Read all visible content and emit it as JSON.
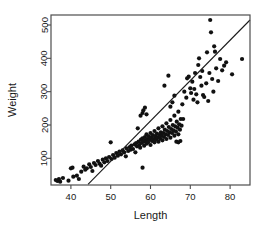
{
  "chart_data": {
    "type": "scatter",
    "title": "",
    "xlabel": "Length",
    "ylabel": "Weight",
    "xlim": [
      35,
      85
    ],
    "ylim": [
      20,
      530
    ],
    "xticks": [
      40,
      50,
      60,
      70,
      80
    ],
    "yticks": [
      100,
      200,
      300,
      400,
      500
    ],
    "xtick_labels": [
      "40",
      "50",
      "60",
      "70",
      "80"
    ],
    "ytick_labels": [
      "100",
      "200",
      "300",
      "400",
      "500"
    ],
    "grid": false,
    "legend": null,
    "point_color": "#111111",
    "line_color": "#1a1a1a",
    "frame_color": "#4d4d4d",
    "background": "#ffffff",
    "ytick_label_rotation": -90,
    "ylabel_rotation": -90,
    "fit_line": {
      "type": "linear-regression",
      "x_start": 44.3,
      "y_start": 22,
      "x_end": 85.0,
      "y_end": 515
    },
    "n_points": 162,
    "points": [
      [
        36.2,
        35
      ],
      [
        36.6,
        32
      ],
      [
        37.0,
        38
      ],
      [
        37.3,
        30
      ],
      [
        38.0,
        41
      ],
      [
        39.4,
        33
      ],
      [
        40.0,
        70
      ],
      [
        40.4,
        72
      ],
      [
        40.6,
        45
      ],
      [
        41.5,
        48
      ],
      [
        42.0,
        38
      ],
      [
        42.6,
        60
      ],
      [
        43.2,
        75
      ],
      [
        43.6,
        66
      ],
      [
        44.0,
        70
      ],
      [
        44.6,
        82
      ],
      [
        45.0,
        74
      ],
      [
        45.4,
        62
      ],
      [
        45.8,
        86
      ],
      [
        46.2,
        80
      ],
      [
        46.8,
        92
      ],
      [
        47.2,
        84
      ],
      [
        47.6,
        78
      ],
      [
        48.0,
        96
      ],
      [
        48.4,
        88
      ],
      [
        48.8,
        100
      ],
      [
        49.2,
        92
      ],
      [
        49.6,
        104
      ],
      [
        50.0,
        148
      ],
      [
        50.2,
        98
      ],
      [
        50.6,
        110
      ],
      [
        51.0,
        102
      ],
      [
        51.4,
        116
      ],
      [
        51.8,
        108
      ],
      [
        52.2,
        120
      ],
      [
        52.6,
        112
      ],
      [
        53.0,
        124
      ],
      [
        53.4,
        118
      ],
      [
        53.8,
        106
      ],
      [
        54.0,
        130
      ],
      [
        54.4,
        122
      ],
      [
        54.8,
        134
      ],
      [
        55.0,
        126
      ],
      [
        55.2,
        138
      ],
      [
        55.6,
        128
      ],
      [
        56.0,
        142
      ],
      [
        56.2,
        118
      ],
      [
        56.4,
        146
      ],
      [
        56.6,
        136
      ],
      [
        56.8,
        190
      ],
      [
        57.0,
        150
      ],
      [
        57.2,
        140
      ],
      [
        57.4,
        132
      ],
      [
        57.6,
        156
      ],
      [
        57.8,
        146
      ],
      [
        58.0,
        160
      ],
      [
        58.0,
        72
      ],
      [
        58.2,
        150
      ],
      [
        58.4,
        138
      ],
      [
        58.6,
        164
      ],
      [
        58.8,
        154
      ],
      [
        59.0,
        144
      ],
      [
        59.0,
        172
      ],
      [
        59.2,
        158
      ],
      [
        59.4,
        148
      ],
      [
        59.6,
        166
      ],
      [
        59.8,
        156
      ],
      [
        60.0,
        140
      ],
      [
        60.0,
        176
      ],
      [
        60.2,
        162
      ],
      [
        60.4,
        152
      ],
      [
        60.6,
        170
      ],
      [
        60.8,
        158
      ],
      [
        61.0,
        148
      ],
      [
        61.0,
        182
      ],
      [
        61.2,
        166
      ],
      [
        61.4,
        156
      ],
      [
        61.6,
        174
      ],
      [
        61.8,
        162
      ],
      [
        62.0,
        150
      ],
      [
        62.0,
        190
      ],
      [
        62.2,
        170
      ],
      [
        62.4,
        160
      ],
      [
        62.6,
        178
      ],
      [
        62.8,
        168
      ],
      [
        63.0,
        154
      ],
      [
        63.0,
        196
      ],
      [
        63.2,
        176
      ],
      [
        63.4,
        164
      ],
      [
        63.6,
        186
      ],
      [
        63.8,
        172
      ],
      [
        64.0,
        158
      ],
      [
        64.0,
        205
      ],
      [
        64.2,
        182
      ],
      [
        64.4,
        170
      ],
      [
        64.6,
        194
      ],
      [
        64.8,
        178
      ],
      [
        65.0,
        162
      ],
      [
        65.0,
        215
      ],
      [
        65.2,
        188
      ],
      [
        65.4,
        176
      ],
      [
        65.6,
        200
      ],
      [
        65.8,
        184
      ],
      [
        66.0,
        168
      ],
      [
        66.0,
        228
      ],
      [
        66.2,
        196
      ],
      [
        66.4,
        180
      ],
      [
        66.6,
        210
      ],
      [
        66.8,
        192
      ],
      [
        67.0,
        172
      ],
      [
        67.0,
        240
      ],
      [
        67.2,
        202
      ],
      [
        67.4,
        186
      ],
      [
        67.6,
        218
      ],
      [
        67.8,
        198
      ],
      [
        57.5,
        228
      ],
      [
        58.0,
        236
      ],
      [
        58.2,
        244
      ],
      [
        58.6,
        252
      ],
      [
        59.0,
        232
      ],
      [
        63.5,
        318
      ],
      [
        64.5,
        348
      ],
      [
        65.0,
        255
      ],
      [
        65.5,
        268
      ],
      [
        66.0,
        288
      ],
      [
        66.5,
        150
      ],
      [
        67.0,
        148
      ],
      [
        67.5,
        152
      ],
      [
        68.0,
        262
      ],
      [
        68.2,
        218
      ],
      [
        68.5,
        300
      ],
      [
        69.0,
        282
      ],
      [
        69.2,
        340
      ],
      [
        69.6,
        345
      ],
      [
        70.0,
        310
      ],
      [
        70.2,
        296
      ],
      [
        70.5,
        330
      ],
      [
        70.8,
        276
      ],
      [
        71.0,
        308
      ],
      [
        71.2,
        356
      ],
      [
        71.5,
        292
      ],
      [
        71.8,
        268
      ],
      [
        72.0,
        380
      ],
      [
        72.2,
        400
      ],
      [
        72.5,
        344
      ],
      [
        72.8,
        318
      ],
      [
        73.0,
        362
      ],
      [
        73.2,
        290
      ],
      [
        73.5,
        284
      ],
      [
        74.0,
        325
      ],
      [
        74.2,
        418
      ],
      [
        74.5,
        272
      ],
      [
        74.8,
        356
      ],
      [
        75.0,
        515
      ],
      [
        75.2,
        478
      ],
      [
        75.5,
        338
      ],
      [
        75.8,
        300
      ],
      [
        76.0,
        436
      ],
      [
        76.2,
        420
      ],
      [
        76.5,
        370
      ],
      [
        77.0,
        332
      ],
      [
        77.5,
        398
      ],
      [
        78.0,
        364
      ],
      [
        78.5,
        378
      ],
      [
        79.0,
        388
      ],
      [
        80.5,
        352
      ],
      [
        83.0,
        398
      ]
    ]
  },
  "geometry": {
    "plot_left": 51,
    "plot_right": 250,
    "plot_top": 15,
    "plot_bottom": 185
  }
}
